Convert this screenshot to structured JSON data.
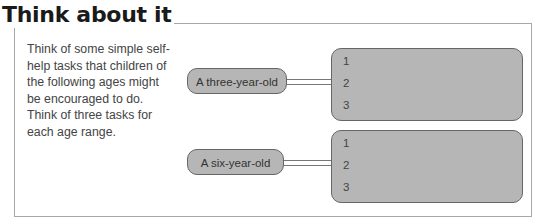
{
  "title": "Think about it",
  "description": "Think of some simple self-help tasks that children of the following ages might be encouraged to do. Think of three tasks for each age range.",
  "groups": [
    {
      "label": "A three-year-old",
      "items": [
        "1",
        "2",
        "3"
      ]
    },
    {
      "label": "A six-year-old",
      "items": [
        "1",
        "2",
        "3"
      ]
    }
  ]
}
